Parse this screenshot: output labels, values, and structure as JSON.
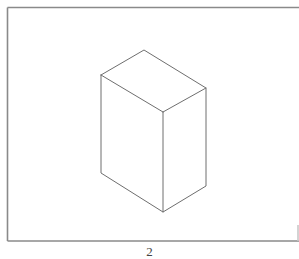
{
  "figure": {
    "type": "isometric-box-line-drawing",
    "label": "2",
    "frame": {
      "left": 7.5,
      "top": 7.5,
      "right": 298,
      "bottom": 241
    },
    "vertices": {
      "top_back": [
        144,
        50
      ],
      "top_left": [
        101,
        75
      ],
      "top_right": [
        206,
        88
      ],
      "top_front": [
        163,
        112
      ],
      "bottom_left": [
        101,
        173
      ],
      "bottom_right": [
        206,
        186
      ],
      "bottom_front": [
        163,
        212
      ]
    },
    "colors": {
      "line": "#6e6e6e",
      "frame": "#8a8a8a",
      "background": "#ffffff"
    }
  }
}
